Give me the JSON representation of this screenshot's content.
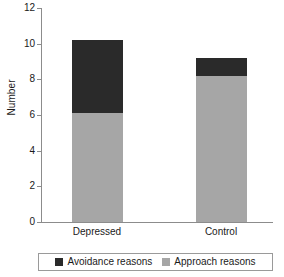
{
  "chart_data": {
    "type": "bar",
    "stacked": true,
    "title": "",
    "xlabel": "",
    "ylabel": "Number",
    "categories": [
      "Depressed",
      "Control"
    ],
    "series": [
      {
        "name": "Approach reasons",
        "values": [
          6.1,
          8.2
        ],
        "color": "#a6a6a6"
      },
      {
        "name": "Avoidance reasons",
        "values": [
          4.1,
          1.0
        ],
        "color": "#2a2a2a"
      }
    ],
    "totals": [
      10.2,
      9.2
    ],
    "ylim": [
      0,
      12
    ],
    "yticks": [
      0,
      2,
      4,
      6,
      8,
      10,
      12
    ],
    "ytick_labels": [
      "0",
      "2",
      "4",
      "6",
      "8",
      "10",
      "12"
    ],
    "grid": false,
    "legend_position": "bottom",
    "legend": [
      {
        "label": "Avoidance reasons",
        "color": "#2a2a2a"
      },
      {
        "label": "Approach reasons",
        "color": "#a6a6a6"
      }
    ]
  },
  "axis": {
    "y_title": "Number",
    "line_color": "#8c8c8c"
  },
  "colors": {
    "avoidance": "#2a2a2a",
    "approach": "#a6a6a6",
    "axis": "#8c8c8c",
    "text": "#1a1a1a",
    "background": "#ffffff",
    "legend_border": "#9a9a9a"
  }
}
